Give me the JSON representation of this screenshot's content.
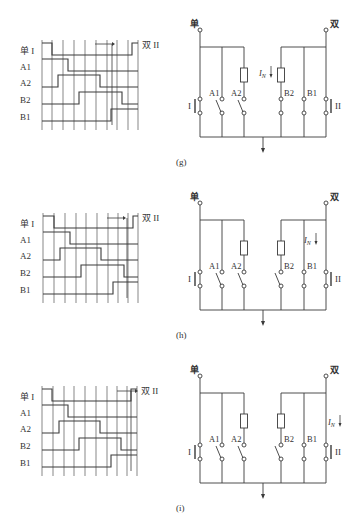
{
  "panels": [
    {
      "id": "g",
      "caption": "(g)",
      "offset_y": 0,
      "timing": {
        "labels": [
          "单 I",
          "A1",
          "A2",
          "B2",
          "B1"
        ],
        "end_label": "双 II",
        "grid_x": [
          42,
          52,
          63,
          74,
          85,
          96,
          107,
          117,
          128,
          138
        ],
        "rows_y": [
          55,
          71,
          87,
          104,
          121
        ],
        "high_offset": 6,
        "signals": [
          {
            "name": "单 I",
            "segments": [
              [
                42,
                1
              ],
              [
                52,
                0
              ],
              [
                132,
                1
              ],
              [
                138,
                1
              ]
            ]
          },
          {
            "name": "A1",
            "segments": [
              [
                42,
                1
              ],
              [
                68,
                0
              ],
              [
                138,
                0
              ]
            ]
          },
          {
            "name": "A2",
            "segments": [
              [
                42,
                0
              ],
              [
                58,
                1
              ],
              [
                100,
                0
              ],
              [
                138,
                0
              ]
            ]
          },
          {
            "name": "B2",
            "segments": [
              [
                42,
                0
              ],
              [
                79,
                1
              ],
              [
                122,
                0
              ],
              [
                138,
                0
              ]
            ]
          },
          {
            "name": "B1",
            "segments": [
              [
                42,
                0
              ],
              [
                111,
                1
              ],
              [
                138,
                1
              ]
            ]
          }
        ],
        "arrow": {
          "x1": 95,
          "x2": 112,
          "y": 44,
          "drop_x": 112,
          "drop_to": 125
        }
      },
      "circuit": {
        "top_left_label": "单",
        "top_right_label": "双",
        "branches_left": [
          "I",
          "A1",
          "A2"
        ],
        "branches_right": [
          "B2",
          "B1",
          "II"
        ],
        "current_label": "I",
        "current_subscript": "N",
        "current_position": "B2",
        "states": {
          "I": "closed",
          "A1": "open",
          "A2": "open",
          "B2": "closed",
          "B1": "closed",
          "II": "closed"
        }
      }
    },
    {
      "id": "h",
      "caption": "(h)",
      "offset_y": 173,
      "timing": {
        "labels": [
          "单 I",
          "A1",
          "A2",
          "B2",
          "B1"
        ],
        "end_label": "双 II",
        "grid_x": [
          43,
          54,
          65,
          76,
          86,
          97,
          108,
          118,
          128,
          138
        ],
        "rows_y": [
          55,
          71,
          87,
          104,
          121
        ],
        "high_offset": 6,
        "signals": [
          {
            "name": "单 I",
            "segments": [
              [
                43,
                1
              ],
              [
                54,
                0
              ],
              [
                133,
                1
              ],
              [
                138,
                1
              ]
            ]
          },
          {
            "name": "A1",
            "segments": [
              [
                43,
                1
              ],
              [
                70,
                0
              ],
              [
                138,
                0
              ]
            ]
          },
          {
            "name": "A2",
            "segments": [
              [
                43,
                0
              ],
              [
                60,
                1
              ],
              [
                101,
                0
              ],
              [
                138,
                0
              ]
            ]
          },
          {
            "name": "B2",
            "segments": [
              [
                43,
                0
              ],
              [
                81,
                1
              ],
              [
                124,
                0
              ],
              [
                138,
                0
              ]
            ]
          },
          {
            "name": "B1",
            "segments": [
              [
                43,
                0
              ],
              [
                113,
                1
              ],
              [
                138,
                1
              ]
            ]
          }
        ],
        "arrow": {
          "x1": 107,
          "x2": 123,
          "y": 45,
          "drop_x": 127,
          "drop_to": 125
        }
      },
      "circuit": {
        "top_left_label": "单",
        "top_right_label": "双",
        "branches_left": [
          "I",
          "A1",
          "A2"
        ],
        "branches_right": [
          "B2",
          "B1",
          "II"
        ],
        "current_label": "I",
        "current_subscript": "N",
        "current_position": "B1",
        "states": {
          "I": "closed",
          "A1": "open",
          "A2": "open",
          "B2": "open",
          "B1": "closed",
          "II": "closed"
        }
      }
    },
    {
      "id": "i",
      "caption": "(i)",
      "offset_y": 346,
      "timing": {
        "labels": [
          "单 I",
          "A1",
          "A2",
          "B2",
          "B1"
        ],
        "end_label": "双 II",
        "grid_x": [
          42,
          53,
          64,
          74,
          85,
          96,
          107,
          117,
          127,
          137
        ],
        "rows_y": [
          55,
          71,
          87,
          104,
          121
        ],
        "high_offset": 6,
        "signals": [
          {
            "name": "单 I",
            "segments": [
              [
                42,
                1
              ],
              [
                52,
                0
              ],
              [
                131,
                1
              ],
              [
                137,
                1
              ]
            ]
          },
          {
            "name": "A1",
            "segments": [
              [
                42,
                1
              ],
              [
                68,
                0
              ],
              [
                137,
                0
              ]
            ]
          },
          {
            "name": "A2",
            "segments": [
              [
                42,
                0
              ],
              [
                59,
                1
              ],
              [
                100,
                0
              ],
              [
                137,
                0
              ]
            ]
          },
          {
            "name": "B2",
            "segments": [
              [
                42,
                0
              ],
              [
                79,
                1
              ],
              [
                121,
                0
              ],
              [
                137,
                0
              ]
            ]
          },
          {
            "name": "B1",
            "segments": [
              [
                42,
                0
              ],
              [
                111,
                1
              ],
              [
                137,
                1
              ]
            ]
          }
        ],
        "arrow": {
          "x1": 117,
          "x2": 135,
          "y": 45,
          "drop_x": 131,
          "drop_to": 125
        }
      },
      "circuit": {
        "top_left_label": "单",
        "top_right_label": "双",
        "branches_left": [
          "I",
          "A1",
          "A2"
        ],
        "branches_right": [
          "B2",
          "B1",
          "II"
        ],
        "current_label": "I",
        "current_subscript": "N",
        "current_position": "II",
        "states": {
          "I": "closed",
          "A1": "open",
          "A2": "open",
          "B2": "open",
          "B1": "closed",
          "II": "closed"
        }
      }
    }
  ],
  "colors": {
    "line": "#3a3a3a",
    "grid": "#555555",
    "text": "#333333",
    "background": "#ffffff"
  }
}
